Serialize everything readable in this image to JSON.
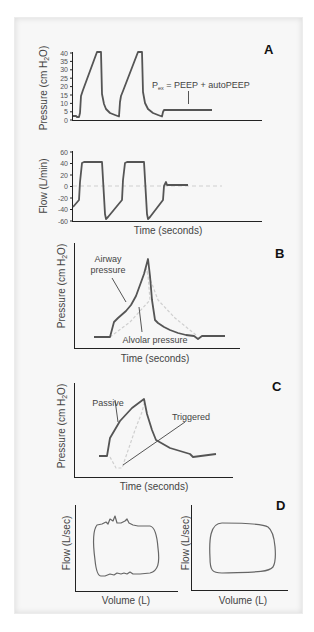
{
  "figure": {
    "panels": {
      "A": {
        "letter": "A",
        "pressure_chart": {
          "ylabel_main": "Pressure (cm H",
          "ylabel_sub": "2",
          "ylabel_end": "O)",
          "yticks": [
            "40",
            "35",
            "30",
            "25",
            "20",
            "15",
            "10",
            "5",
            "0"
          ],
          "annotation_p": "P",
          "annotation_sub": "ex",
          "annotation_rest": " = PEEP + autoPEEP"
        },
        "flow_chart": {
          "ylabel": "Flow (L/min)",
          "yticks": [
            "60",
            "40",
            "20",
            "0",
            "-20",
            "-40",
            "-60"
          ],
          "xlabel": "Time (seconds)"
        }
      },
      "B": {
        "letter": "B",
        "ylabel_main": "Pressure (cm H",
        "ylabel_sub": "2",
        "ylabel_end": "O)",
        "xlabel": "Time (seconds)",
        "label_airway_1": "Airway",
        "label_airway_2": "pressure",
        "label_alveolar": "Alvolar pressure"
      },
      "C": {
        "letter": "C",
        "ylabel_main": "Pressure (cm H",
        "ylabel_sub": "2",
        "ylabel_end": "O)",
        "xlabel": "Time (seconds)",
        "label_passive": "Passive",
        "label_triggered": "Triggered"
      },
      "D": {
        "letter": "D",
        "left": {
          "ylabel": "Flow (L/sec)",
          "xlabel": "Volume (L)"
        },
        "right": {
          "ylabel": "Flow (L/sec)",
          "xlabel": "Volume (L)"
        }
      }
    },
    "colors": {
      "trace": "#555555",
      "dashed": "#c8c8c8",
      "axis": "#222222",
      "frame_bg": "#f7f7f7"
    }
  }
}
